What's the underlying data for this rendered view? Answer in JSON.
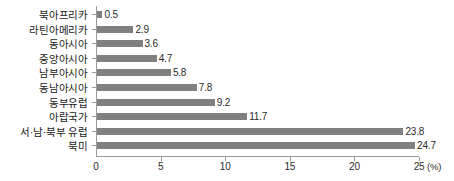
{
  "chart_data": {
    "type": "bar",
    "orientation": "horizontal",
    "title": "",
    "subtitle": "",
    "xlabel": "(%)",
    "ylabel": "",
    "unit_label": "(%)",
    "xlim": [
      0,
      25
    ],
    "xticks": [
      0,
      5,
      10,
      15,
      20,
      25
    ],
    "xtick_labels": [
      "0",
      "5",
      "10",
      "15",
      "20",
      "25"
    ],
    "grid": false,
    "legend": null,
    "bar_color": "#808080",
    "axis_color": "#9a9a9a",
    "text_color": "#1a1a1a",
    "background": "#ffffff",
    "categories": [
      "북아프리카",
      "라틴아메리카",
      "동아시아",
      "중앙아시아",
      "남부아시아",
      "동남아시아",
      "동부유럽",
      "아랍국가",
      "서·남·북부 유럽",
      "북미"
    ],
    "values": [
      0.5,
      2.9,
      3.6,
      4.7,
      5.8,
      7.8,
      9.2,
      11.7,
      23.8,
      24.7
    ],
    "value_labels": [
      "0.5",
      "2.9",
      "3.6",
      "4.7",
      "5.8",
      "7.8",
      "9.2",
      "11.7",
      "23.8",
      "24.7"
    ]
  }
}
